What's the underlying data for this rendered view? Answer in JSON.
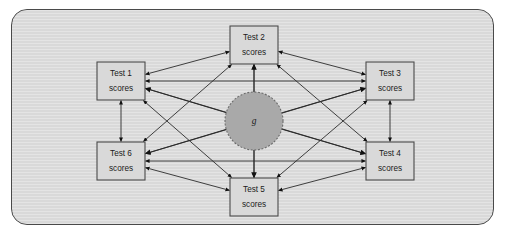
{
  "figure": {
    "type": "path-diagram",
    "frame": {
      "shape": "rounded-rectangle",
      "fill_color": "#d9d9d9",
      "border_color": "#4a4a4a"
    }
  },
  "latent_factor": {
    "label": "g",
    "shape": "circle",
    "fill_color": "#a9a9a9",
    "border_style": "dashed",
    "border_color": "#6b6b6b",
    "center": {
      "x": 254,
      "y": 121
    },
    "radius": 29
  },
  "nodes": [
    {
      "id": "test1",
      "line1": "Test 1",
      "line2": "scores",
      "x": 97,
      "y": 62,
      "width": 48,
      "height": 38
    },
    {
      "id": "test2",
      "line1": "Test 2",
      "line2": "scores",
      "x": 230,
      "y": 26,
      "width": 48,
      "height": 38
    },
    {
      "id": "test3",
      "line1": "Test 3",
      "line2": "scores",
      "x": 366,
      "y": 62,
      "width": 48,
      "height": 38
    },
    {
      "id": "test4",
      "line1": "Test 4",
      "line2": "scores",
      "x": 366,
      "y": 142,
      "width": 48,
      "height": 38
    },
    {
      "id": "test5",
      "line1": "Test 5",
      "line2": "scores",
      "x": 230,
      "y": 178,
      "width": 48,
      "height": 38
    },
    {
      "id": "test6",
      "line1": "Test 6",
      "line2": "scores",
      "x": 97,
      "y": 142,
      "width": 48,
      "height": 38
    }
  ],
  "factor_edges": [
    {
      "from": "g",
      "to": "test1",
      "direction": "single"
    },
    {
      "from": "g",
      "to": "test2",
      "direction": "single"
    },
    {
      "from": "g",
      "to": "test3",
      "direction": "single"
    },
    {
      "from": "g",
      "to": "test4",
      "direction": "single"
    },
    {
      "from": "g",
      "to": "test5",
      "direction": "single"
    },
    {
      "from": "g",
      "to": "test6",
      "direction": "single"
    }
  ],
  "correlation_edges": [
    {
      "from": "test1",
      "to": "test2",
      "direction": "double"
    },
    {
      "from": "test1",
      "to": "test3",
      "direction": "double"
    },
    {
      "from": "test1",
      "to": "test4",
      "direction": "double"
    },
    {
      "from": "test1",
      "to": "test5",
      "direction": "double"
    },
    {
      "from": "test1",
      "to": "test6",
      "direction": "double"
    },
    {
      "from": "test2",
      "to": "test3",
      "direction": "double"
    },
    {
      "from": "test2",
      "to": "test4",
      "direction": "double"
    },
    {
      "from": "test2",
      "to": "test5",
      "direction": "double"
    },
    {
      "from": "test2",
      "to": "test6",
      "direction": "double"
    },
    {
      "from": "test3",
      "to": "test4",
      "direction": "double"
    },
    {
      "from": "test3",
      "to": "test5",
      "direction": "double"
    },
    {
      "from": "test3",
      "to": "test6",
      "direction": "double"
    },
    {
      "from": "test4",
      "to": "test5",
      "direction": "double"
    },
    {
      "from": "test4",
      "to": "test6",
      "direction": "double"
    },
    {
      "from": "test5",
      "to": "test6",
      "direction": "double"
    }
  ]
}
